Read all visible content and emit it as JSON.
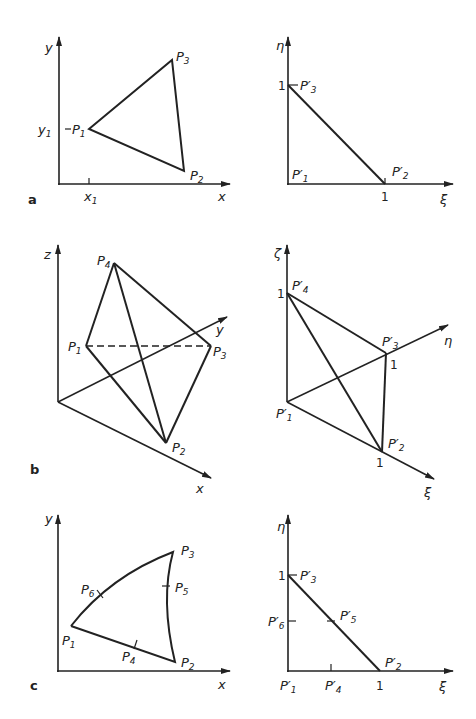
{
  "panels": {
    "a": {
      "tag": "a",
      "left": {
        "axes": {
          "x": "x",
          "y": "y"
        },
        "ticks": {
          "x1": "x",
          "x1_sub": "1",
          "y1": "y",
          "y1_sub": "1"
        },
        "points": [
          {
            "name": "P",
            "sub": "1"
          },
          {
            "name": "P",
            "sub": "2"
          },
          {
            "name": "P",
            "sub": "3"
          }
        ]
      },
      "right": {
        "axes": {
          "xi": "ξ",
          "eta": "η"
        },
        "ticks": {
          "xi_one": "1",
          "eta_one": "1"
        },
        "points": [
          {
            "name": "P′",
            "sub": "1"
          },
          {
            "name": "P′",
            "sub": "2"
          },
          {
            "name": "P′",
            "sub": "3"
          }
        ]
      }
    },
    "b": {
      "tag": "b",
      "left": {
        "axes": {
          "x": "x",
          "y": "y",
          "z": "z"
        },
        "points": [
          {
            "name": "P",
            "sub": "1"
          },
          {
            "name": "P",
            "sub": "2"
          },
          {
            "name": "P",
            "sub": "3"
          },
          {
            "name": "P",
            "sub": "4"
          }
        ]
      },
      "right": {
        "axes": {
          "xi": "ξ",
          "eta": "η",
          "zeta": "ζ"
        },
        "ticks": {
          "xi_one": "1",
          "eta_one": "1",
          "zeta_one": "1"
        },
        "points": [
          {
            "name": "P′",
            "sub": "1"
          },
          {
            "name": "P′",
            "sub": "2"
          },
          {
            "name": "P′",
            "sub": "3"
          },
          {
            "name": "P′",
            "sub": "4"
          }
        ]
      }
    },
    "c": {
      "tag": "c",
      "left": {
        "axes": {
          "x": "x",
          "y": "y"
        },
        "points": [
          {
            "name": "P",
            "sub": "1"
          },
          {
            "name": "P",
            "sub": "2"
          },
          {
            "name": "P",
            "sub": "3"
          },
          {
            "name": "P",
            "sub": "4"
          },
          {
            "name": "P",
            "sub": "5"
          },
          {
            "name": "P",
            "sub": "6"
          }
        ]
      },
      "right": {
        "axes": {
          "xi": "ξ",
          "eta": "η"
        },
        "ticks": {
          "xi_one": "1",
          "eta_one": "1"
        },
        "points": [
          {
            "name": "P′",
            "sub": "1"
          },
          {
            "name": "P′",
            "sub": "2"
          },
          {
            "name": "P′",
            "sub": "3"
          },
          {
            "name": "P′",
            "sub": "4"
          },
          {
            "name": "P′",
            "sub": "5"
          },
          {
            "name": "P′",
            "sub": "6"
          }
        ]
      }
    }
  },
  "colors": {
    "ink": "#222222",
    "background": "#ffffff"
  }
}
